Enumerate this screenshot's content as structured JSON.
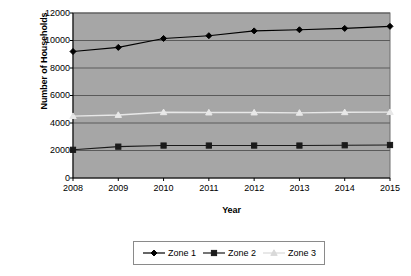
{
  "chart_data": {
    "type": "line",
    "title": "",
    "subtitle": "",
    "xlabel": "Year",
    "ylabel": "Number of Households",
    "categories": [
      "2008",
      "2009",
      "2010",
      "2011",
      "2012",
      "2013",
      "2014",
      "2015"
    ],
    "x": [
      2008,
      2009,
      2010,
      2011,
      2012,
      2013,
      2014,
      2015
    ],
    "xlim": [
      2008,
      2015
    ],
    "ylim": [
      0,
      12000
    ],
    "yticks": [
      0,
      2000,
      4000,
      6000,
      8000,
      10000,
      12000
    ],
    "ytick_labels": [
      "0",
      "2000",
      "4000",
      "6000",
      "8000",
      "10000",
      "12000"
    ],
    "grid": "horizontal",
    "plot_background": "#a6a6a6",
    "figure_background": "#ffffff",
    "legend_position": "bottom",
    "series": [
      {
        "name": "Zone 1",
        "marker": "diamond",
        "color": "#000000",
        "values": [
          9200,
          9500,
          10150,
          10350,
          10700,
          10780,
          10880,
          11030
        ]
      },
      {
        "name": "Zone 2",
        "marker": "square",
        "color": "#1a1a1a",
        "values": [
          2050,
          2280,
          2360,
          2360,
          2360,
          2360,
          2380,
          2400
        ]
      },
      {
        "name": "Zone 3",
        "marker": "triangle",
        "color": "#e8e8e8",
        "values": [
          4500,
          4580,
          4780,
          4760,
          4760,
          4740,
          4780,
          4790
        ]
      }
    ]
  },
  "legend": {
    "items": [
      {
        "label": "Zone 1",
        "marker": "diamond",
        "color": "#000000"
      },
      {
        "label": "Zone 2",
        "marker": "square",
        "color": "#1a1a1a"
      },
      {
        "label": "Zone 3",
        "marker": "triangle",
        "color": "#d9d9d9"
      }
    ]
  }
}
